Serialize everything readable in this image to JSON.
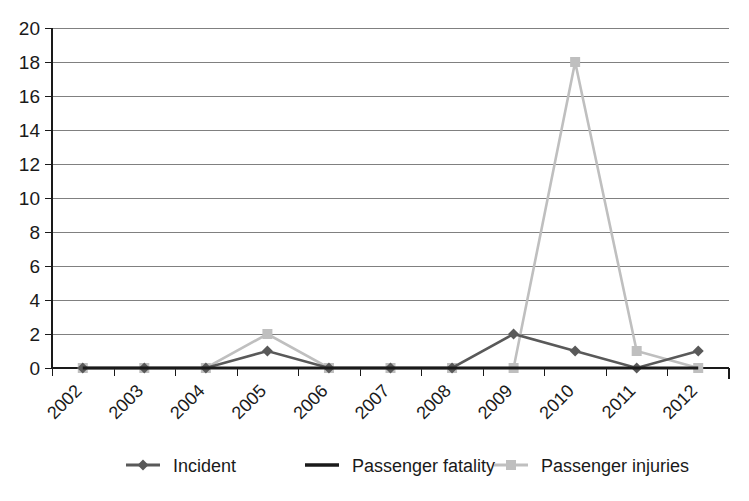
{
  "chart_data": {
    "type": "line",
    "title": "",
    "subtitle": "",
    "xlabel": "",
    "ylabel": "",
    "categories": [
      "2002",
      "2003",
      "2004",
      "2005",
      "2006",
      "2007",
      "2008",
      "2009",
      "2010",
      "2011",
      "2012"
    ],
    "ylim": [
      0,
      20
    ],
    "ytick_labels": [
      "0",
      "2",
      "4",
      "6",
      "8",
      "10",
      "12",
      "14",
      "16",
      "18",
      "20"
    ],
    "ytick_values": [
      0,
      2,
      4,
      6,
      8,
      10,
      12,
      14,
      16,
      18,
      20
    ],
    "grid": "horizontal",
    "legend_position": "bottom",
    "series": [
      {
        "name": "Incident",
        "marker": "diamond",
        "color": "#595959",
        "values": [
          0,
          0,
          0,
          1,
          0,
          0,
          0,
          2,
          1,
          0,
          1
        ]
      },
      {
        "name": "Passenger fatality",
        "marker": "none",
        "color": "#1a1a1a",
        "values": [
          0,
          0,
          0,
          0,
          0,
          0,
          0,
          0,
          0,
          0,
          0
        ]
      },
      {
        "name": "Passenger injuries",
        "marker": "square",
        "color": "#bfbfbf",
        "values": [
          0,
          0,
          0,
          2,
          0,
          0,
          0,
          0,
          18,
          1,
          0
        ]
      }
    ]
  },
  "colors": {
    "background": "#ffffff",
    "axis": "#1a1a1a",
    "gridline": "#808080",
    "incident": "#595959",
    "passenger_fatality": "#1a1a1a",
    "passenger_injuries": "#bfbfbf"
  }
}
